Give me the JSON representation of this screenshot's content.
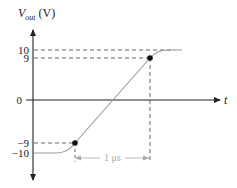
{
  "diagram": {
    "y_axis_label_main": "V",
    "y_axis_label_sub": "out",
    "y_axis_unit": " (V)",
    "x_axis_label": "t",
    "y_ticks": [
      {
        "label": "10",
        "value": 10
      },
      {
        "label": "9",
        "value": 9
      },
      {
        "label": "0",
        "value": 0
      },
      {
        "label": "−9",
        "value": -9
      },
      {
        "label": "−10",
        "value": -10
      }
    ],
    "rise_time_label": "1 μs",
    "markers": [
      {
        "name": "low-10-percent-point",
        "value": -9
      },
      {
        "name": "high-90-percent-point",
        "value": 9
      }
    ],
    "colors": {
      "axis": "#222222",
      "curve": "#9a9a9a",
      "dashed": "#444444",
      "dimension": "#aaaaaa"
    }
  }
}
